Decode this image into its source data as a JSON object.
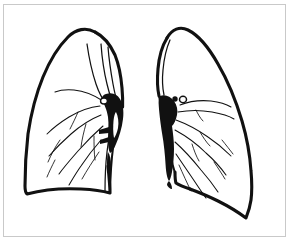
{
  "figure": {
    "style": "black and white ink line drawing",
    "caption": "",
    "background_color": "#ffffff",
    "ink_color": "#111111",
    "frame_color": "#c9c9c9",
    "canvas": {
      "width": 292,
      "height": 245
    }
  },
  "frame": {
    "name": "thin rectangular border",
    "inset_left": 3,
    "inset_top": 4,
    "width": 283,
    "height": 233
  },
  "anatomy": {
    "left_lung": {
      "label": "right lung (viewer left)",
      "description": "larger lung with rounded apex, convex lateral border, concave diaphragmatic base",
      "features": [
        "apex",
        "lateral border",
        "diaphragmatic base",
        "oblique fissure lines",
        "hilum",
        "bronchial branches"
      ]
    },
    "right_lung": {
      "label": "left lung (viewer right)",
      "description": "narrower lung with cardiac notch along mediastinal border and pointed inferior tip",
      "features": [
        "apex",
        "mediastinal border",
        "cardiac notch",
        "lateral border",
        "diaphragmatic base",
        "hilum",
        "pulmonary vessels"
      ]
    },
    "hilum_left": {
      "label": "hilum",
      "description": "solid black wedge with small bronchial ring",
      "markers": [
        "open bronchus ring"
      ]
    },
    "hilum_right": {
      "label": "hilum",
      "description": "solid black wedge tapering inferiorly with two small vessel markers",
      "markers": [
        "filled vessel dot",
        "open bronchus ring"
      ]
    }
  }
}
